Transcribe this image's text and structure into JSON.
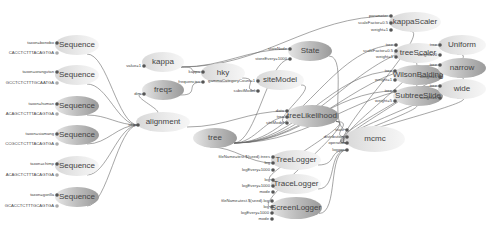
{
  "diagram": {
    "nodes": [
      {
        "id": "seq1",
        "label": "Sequence",
        "x": 77,
        "y": 45,
        "rx": 22,
        "ry": 10,
        "shade": "light",
        "ports": [
          {
            "label": "taxon=bonobo",
            "y": 43
          },
          {
            "label": "CACCTCTTTACAGTGA",
            "y": 53
          }
        ]
      },
      {
        "id": "seq2",
        "label": "Sequence",
        "x": 77,
        "y": 75,
        "rx": 22,
        "ry": 10,
        "shade": "light",
        "ports": [
          {
            "label": "taxon=orangutan",
            "y": 72
          },
          {
            "label": "GCCTCTCTTTGCAATGA",
            "y": 83
          }
        ]
      },
      {
        "id": "seq3",
        "label": "Sequence",
        "x": 77,
        "y": 106,
        "rx": 22,
        "ry": 10,
        "shade": "dark",
        "ports": [
          {
            "label": "taxon=human",
            "y": 104
          },
          {
            "label": "ACAGCTCTTTACAGTGA",
            "y": 114
          }
        ]
      },
      {
        "id": "seq4",
        "label": "Sequence",
        "x": 77,
        "y": 135,
        "rx": 22,
        "ry": 10,
        "shade": "dark",
        "ports": [
          {
            "label": "taxon=siamang",
            "y": 134
          },
          {
            "label": "CCGCCTCTTTACAGTGA",
            "y": 144
          }
        ]
      },
      {
        "id": "seq5",
        "label": "Sequence",
        "x": 77,
        "y": 166,
        "rx": 22,
        "ry": 10,
        "shade": "light",
        "ports": [
          {
            "label": "taxon=chimp",
            "y": 164
          },
          {
            "label": "ACAGCTCTTTACAGTGA",
            "y": 175
          }
        ]
      },
      {
        "id": "seq6",
        "label": "Sequence",
        "x": 77,
        "y": 197,
        "rx": 22,
        "ry": 10,
        "shade": "dark",
        "ports": [
          {
            "label": "taxon=gorilla",
            "y": 195
          },
          {
            "label": "GCACCTCTTTGCAGTGA",
            "y": 206
          }
        ]
      },
      {
        "id": "kappa",
        "label": "kappa",
        "x": 163,
        "y": 62,
        "rx": 21,
        "ry": 10,
        "shade": "light",
        "ports": [
          {
            "label": "value=1",
            "y": 66
          }
        ]
      },
      {
        "id": "freqs",
        "label": "freqs",
        "x": 163,
        "y": 90,
        "rx": 21,
        "ry": 10,
        "shade": "dark",
        "ports": [
          {
            "label": "dim",
            "y": 94
          }
        ]
      },
      {
        "id": "alignment",
        "label": "alignment",
        "x": 163,
        "y": 122,
        "rx": 27,
        "ry": 10,
        "shade": "light",
        "ports": [
          {
            "label": "seq",
            "y": 125
          }
        ]
      },
      {
        "id": "hky",
        "label": "hky",
        "x": 223,
        "y": 73,
        "rx": 22,
        "ry": 10,
        "shade": "light",
        "ports": [
          {
            "label": "kappa",
            "y": 72
          },
          {
            "label": "frequencies",
            "y": 82
          }
        ]
      },
      {
        "id": "siteModel",
        "label": "siteModel",
        "x": 280,
        "y": 80,
        "rx": 24,
        "ry": 10,
        "shade": "light",
        "ports": [
          {
            "label": "gammaCategoryCount=1",
            "y": 81
          },
          {
            "label": "substModel",
            "y": 91
          }
        ]
      },
      {
        "id": "State",
        "label": "State",
        "x": 310,
        "y": 51,
        "rx": 22,
        "ry": 10,
        "shade": "dark",
        "ports": [
          {
            "label": "stateNode",
            "y": 49
          },
          {
            "label": "storeEvery=1000",
            "y": 59
          }
        ]
      },
      {
        "id": "tree",
        "label": "tree",
        "x": 215,
        "y": 138,
        "rx": 22,
        "ry": 10,
        "shade": "dark",
        "ports": []
      },
      {
        "id": "treeLikelihood",
        "label": "treeLikelihood",
        "x": 312,
        "y": 116,
        "rx": 27,
        "ry": 11,
        "shade": "dark",
        "ports": [
          {
            "label": "data",
            "y": 111
          },
          {
            "label": "tree",
            "y": 117
          },
          {
            "label": "siteModel",
            "y": 123
          }
        ]
      },
      {
        "id": "kappaScaler",
        "label": "kappaScaler",
        "x": 415,
        "y": 22,
        "rx": 26,
        "ry": 10,
        "shade": "light",
        "ports": [
          {
            "label": "parameter",
            "y": 16
          },
          {
            "label": "scaleFactor=0.5",
            "y": 23
          },
          {
            "label": "weight=1",
            "y": 30
          }
        ]
      },
      {
        "id": "treeScaler",
        "label": "treeScaler",
        "x": 418,
        "y": 53,
        "rx": 24,
        "ry": 10,
        "shade": "light",
        "ports": [
          {
            "label": "tree",
            "y": 45
          },
          {
            "label": "scaleFactor=0.5",
            "y": 51
          },
          {
            "label": "weight=1",
            "y": 57
          }
        ]
      },
      {
        "id": "WilsonBalding",
        "label": "WilsonBalding",
        "x": 418,
        "y": 75,
        "rx": 25,
        "ry": 10,
        "shade": "dark",
        "ports": [
          {
            "label": "tree",
            "y": 71
          },
          {
            "label": "weight=1",
            "y": 80
          }
        ]
      },
      {
        "id": "SubtreeSlide",
        "label": "SubtreeSlide",
        "x": 418,
        "y": 96,
        "rx": 25,
        "ry": 10,
        "shade": "dark",
        "ports": [
          {
            "label": "tree",
            "y": 91
          },
          {
            "label": "weight=5",
            "y": 101
          }
        ]
      },
      {
        "id": "Uniform",
        "label": "Uniform",
        "x": 462,
        "y": 45,
        "rx": 24,
        "ry": 10,
        "shade": "light",
        "ports": [
          {
            "label": "tree",
            "y": 45
          },
          {
            "label": "weight=10",
            "y": 55
          }
        ]
      },
      {
        "id": "narrow",
        "label": "narrow",
        "x": 462,
        "y": 68,
        "rx": 24,
        "ry": 10,
        "shade": "dark",
        "ports": [
          {
            "label": "tree",
            "y": 65
          },
          {
            "label": "weight=1",
            "y": 77
          }
        ]
      },
      {
        "id": "wide",
        "label": "wide",
        "x": 462,
        "y": 89,
        "rx": 24,
        "ry": 10,
        "shade": "light",
        "ports": [
          {
            "label": "tree",
            "y": 86
          },
          {
            "label": "weight=1",
            "y": 98
          }
        ]
      },
      {
        "id": "mcmc",
        "label": "mcmc",
        "x": 375,
        "y": 139,
        "rx": 30,
        "ry": 13,
        "shade": "light",
        "ports": [
          {
            "label": "state",
            "y": 130
          },
          {
            "label": "distribution",
            "y": 137
          },
          {
            "label": "operator",
            "y": 143
          },
          {
            "label": "logger",
            "y": 150
          }
        ]
      },
      {
        "id": "TreeLogger",
        "label": "TreeLogger",
        "x": 296,
        "y": 160,
        "rx": 25,
        "ry": 10,
        "shade": "light",
        "ports": [
          {
            "label": "fileName=test.$(seed).trees",
            "y": 157
          },
          {
            "label": "log",
            "y": 163
          },
          {
            "label": "logEvery=1000",
            "y": 170
          }
        ]
      },
      {
        "id": "TraceLogger",
        "label": "TraceLogger",
        "x": 296,
        "y": 184,
        "rx": 25,
        "ry": 10,
        "shade": "light",
        "ports": [
          {
            "label": "log",
            "y": 180
          },
          {
            "label": "logEvery=1000",
            "y": 186
          },
          {
            "label": "mode",
            "y": 192
          }
        ]
      },
      {
        "id": "ScreenLogger",
        "label": "ScreenLogger",
        "x": 296,
        "y": 208,
        "rx": 26,
        "ry": 11,
        "shade": "dark",
        "ports": [
          {
            "label": "fileName=test.$(seed).log",
            "y": 201
          },
          {
            "label": "log",
            "y": 207
          },
          {
            "label": "logEvery=1000",
            "y": 213
          },
          {
            "label": "mode",
            "y": 219
          }
        ]
      }
    ],
    "port_labels": {
      "kappaScaler": [
        "parameter",
        "scaleFactor=0.5",
        "weight=1"
      ],
      "treeScaler": [
        "tree",
        "scaleFactor=0.5",
        "weight=1"
      ],
      "mcmc": [
        "state",
        "distribution",
        "operator",
        "logger"
      ]
    }
  }
}
